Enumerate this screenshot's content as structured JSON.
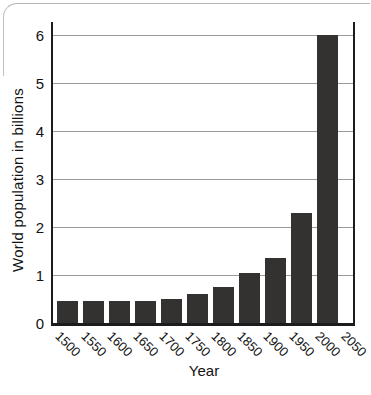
{
  "chart_data": {
    "type": "bar",
    "title": "",
    "xlabel": "Year",
    "ylabel": "World population in billions",
    "categories": [
      "1500",
      "1550",
      "1600",
      "1650",
      "1700",
      "1750",
      "1800",
      "1850",
      "1900",
      "1950",
      "2000",
      "2050"
    ],
    "values": [
      0.45,
      0.45,
      0.45,
      0.45,
      0.5,
      0.6,
      0.75,
      1.05,
      1.35,
      2.3,
      6.0,
      null
    ],
    "ylim": [
      0,
      6
    ],
    "yticks": [
      "0",
      "1",
      "2",
      "3",
      "4",
      "5",
      "6"
    ],
    "grid": true,
    "legend": false,
    "bar_color": "#333231",
    "grid_color": "#9a9a9a",
    "axis_color": "#1c1c1c",
    "text_color": "#121212",
    "background": "#ffffff"
  }
}
